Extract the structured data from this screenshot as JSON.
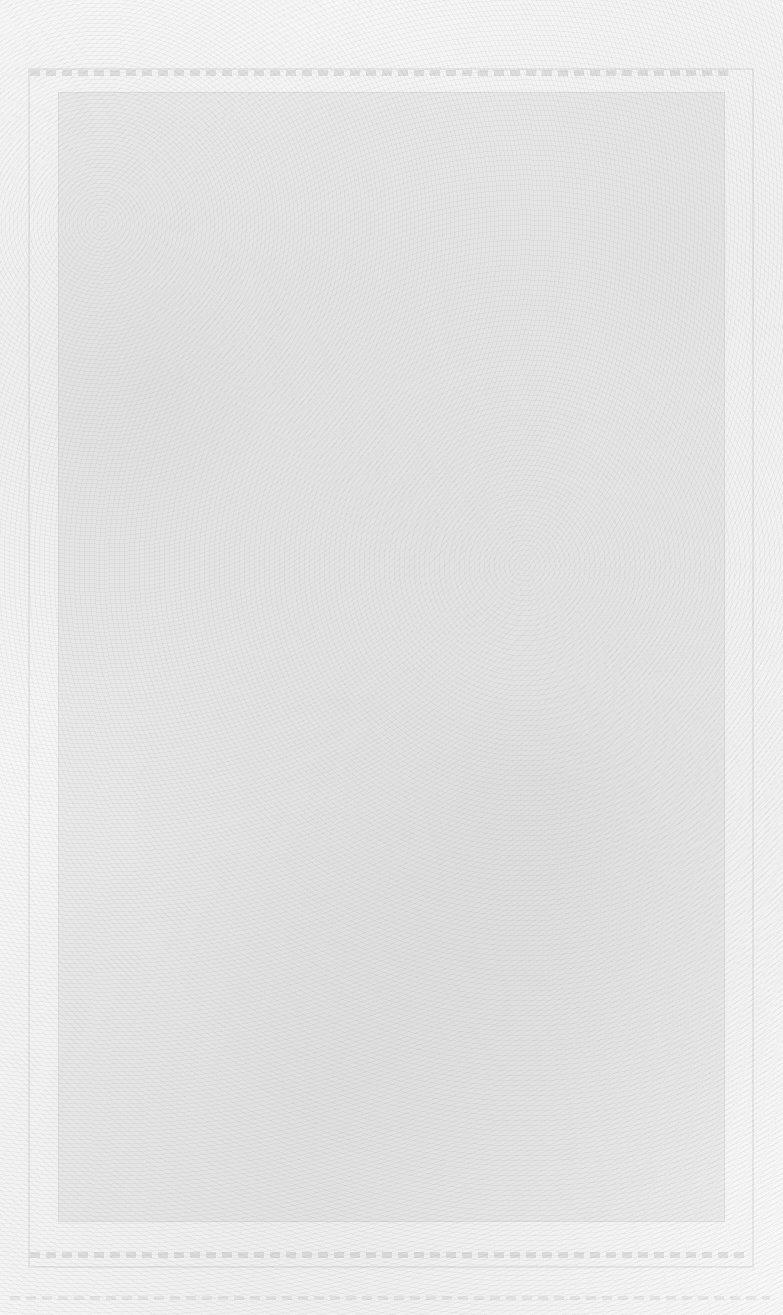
{
  "document": {
    "type": "scanned-page",
    "legible_text": [],
    "notes_visible": ""
  }
}
